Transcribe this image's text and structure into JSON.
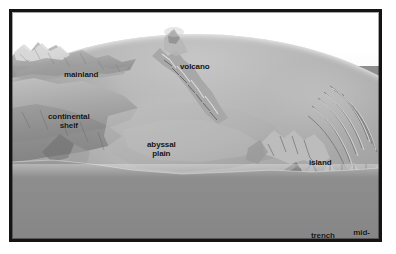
{
  "figure": {
    "frame": {
      "border_color": "#141414",
      "mat_color": "#ffffff",
      "border_width_px": 3
    },
    "palette": {
      "sky": "#ffffff",
      "seafloor_light": "#b8b8b8",
      "seafloor_mid": "#9c9c9c",
      "block_slab": "#8a8a8a",
      "shadow": "#4a4a4a",
      "highlight": "#e8e8e8",
      "label_text": "#111111"
    },
    "labels": [
      {
        "id": "mainland",
        "text": "mainland"
      },
      {
        "id": "volcano",
        "text": "volcano"
      },
      {
        "id": "continental-shelf",
        "text": "continental\nshelf"
      },
      {
        "id": "abyssal-plain",
        "text": "abyssal\nplain"
      },
      {
        "id": "island",
        "text": "island"
      },
      {
        "id": "trench",
        "text": "trench"
      },
      {
        "id": "mid-ocean-ridges",
        "text": "mid-ocean\nridges"
      }
    ]
  }
}
